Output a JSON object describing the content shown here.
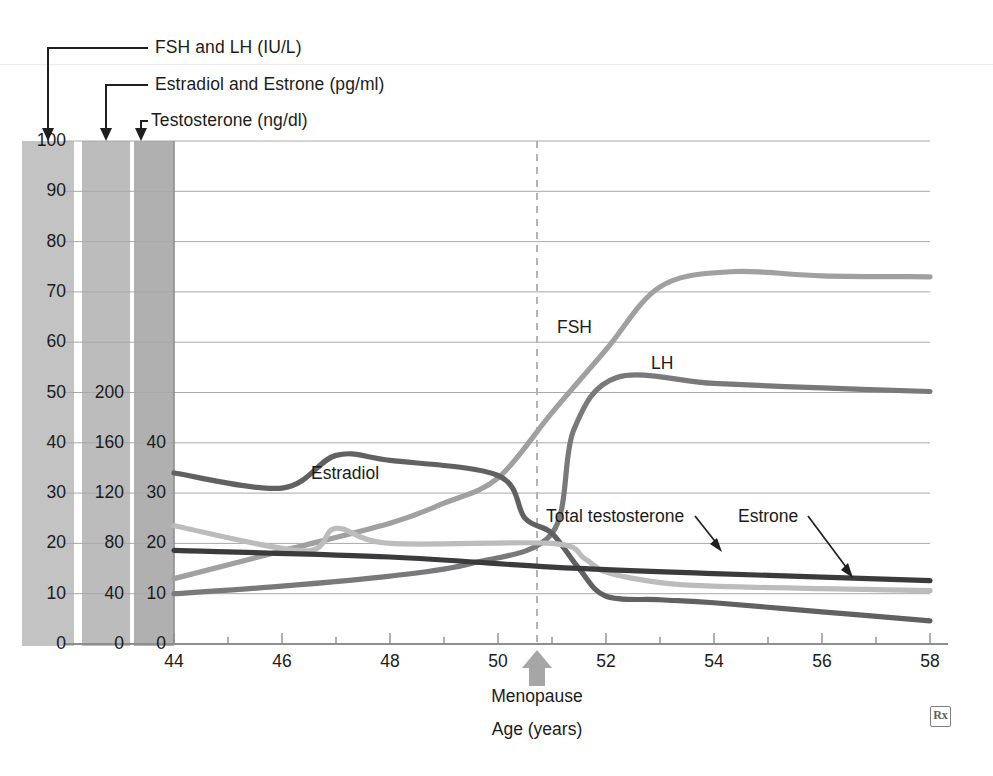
{
  "figure": {
    "axis_callouts": [
      {
        "id": "fsh-lh-axis",
        "label": "FSH and LH (IU/L)"
      },
      {
        "id": "estradiol-estrone-axis",
        "label": "Estradiol and Estrone (pg/ml)"
      },
      {
        "id": "testosterone-axis",
        "label": "Testosterone (ng/dl)"
      }
    ],
    "menopause_marker": {
      "label": "Menopause",
      "age": 51
    },
    "xaxis_title": "Age (years)",
    "watermark": "Rx"
  },
  "chart_data": {
    "type": "line",
    "title": "",
    "xlabel": "Age (years)",
    "ylabel": "",
    "xlim": [
      44,
      58
    ],
    "xticks": [
      44,
      46,
      48,
      50,
      52,
      54,
      56,
      58
    ],
    "xtick_labels": [
      "44",
      "46",
      "48",
      "50",
      "52",
      "54",
      "56",
      "58"
    ],
    "minor_xticks": [
      45,
      47,
      49,
      51,
      53,
      55,
      57
    ],
    "grid": true,
    "legend": "inline-labels",
    "annotations": [
      {
        "text": "Menopause",
        "x": 51,
        "kind": "arrow-up-dashed-line"
      },
      {
        "text": "FSH",
        "x": 51.6,
        "y": 62
      },
      {
        "text": "LH",
        "x": 53.0,
        "y": 56
      },
      {
        "text": "Estradiol",
        "x": 47.4,
        "y": 31
      },
      {
        "text": "Total testosterone",
        "x": 51.1,
        "y": 23
      },
      {
        "text": "Estrone",
        "x": 54.2,
        "y": 23
      }
    ],
    "axes": [
      {
        "id": "fsh-lh-axis",
        "name": "FSH and LH",
        "units": "IU/L",
        "ylim": [
          0,
          100
        ],
        "ticks": [
          0,
          10,
          20,
          30,
          40,
          50,
          60,
          70,
          80,
          90,
          100
        ],
        "tick_labels": [
          "0",
          "10",
          "20",
          "30",
          "40",
          "50",
          "60",
          "70",
          "80",
          "90",
          "100"
        ],
        "band_color": "#c3c3c3"
      },
      {
        "id": "estradiol-estrone-axis",
        "name": "Estradiol and Estrone",
        "units": "pg/ml",
        "ylim": [
          0,
          200
        ],
        "ticks": [
          0,
          40,
          80,
          120,
          160,
          200
        ],
        "tick_labels": [
          "0",
          "40",
          "80",
          "120",
          "160",
          "200"
        ],
        "band_color": "#bcbcbc"
      },
      {
        "id": "testosterone-axis",
        "name": "Testosterone",
        "units": "ng/dl",
        "ylim": [
          0,
          40
        ],
        "ticks": [
          0,
          10,
          20,
          30,
          40
        ],
        "tick_labels": [
          "0",
          "10",
          "20",
          "30",
          "40"
        ],
        "band_color": "#b0b0b0"
      }
    ],
    "series": [
      {
        "name": "FSH",
        "axis": "fsh-lh-axis",
        "units": "IU/L",
        "color": "#a0a0a0",
        "x": [
          44,
          46,
          48,
          49,
          50,
          51,
          52,
          53,
          54.3,
          56,
          58
        ],
        "values": [
          13,
          18.5,
          24,
          28,
          33,
          46,
          58.5,
          71,
          74,
          73.2,
          73
        ]
      },
      {
        "name": "LH",
        "axis": "fsh-lh-axis",
        "units": "IU/L",
        "color": "#79797b",
        "x": [
          44,
          46,
          48,
          49.5,
          51,
          51.4,
          52.2,
          54,
          56,
          58
        ],
        "values": [
          10,
          11.5,
          13.5,
          16,
          22,
          42.5,
          53,
          51.8,
          50.9,
          50.2
        ]
      },
      {
        "name": "Estradiol",
        "axis": "estradiol-estrone-axis",
        "units": "pg/ml",
        "scaled_as_fsh_units": true,
        "color": "#616163",
        "x": [
          44,
          46,
          47,
          48,
          50,
          50.5,
          51,
          51.5,
          52,
          53,
          54,
          56,
          58
        ],
        "values": [
          34,
          31,
          37.5,
          36.5,
          33.5,
          25,
          22,
          15,
          9.5,
          8.8,
          8.2,
          6.4,
          4.6
        ]
      },
      {
        "name": "Estrone",
        "axis": "estradiol-estrone-axis",
        "units": "pg/ml",
        "scaled_as_fsh_units": true,
        "color": "#bcbcbc",
        "x": [
          44,
          46.4,
          47,
          48,
          51,
          51.6,
          52,
          53,
          54,
          56,
          58
        ],
        "values": [
          23.5,
          18.5,
          23,
          20,
          20,
          17,
          14.3,
          12.2,
          11.5,
          11,
          10.6
        ]
      },
      {
        "name": "Total testosterone",
        "axis": "testosterone-axis",
        "units": "ng/dl",
        "scaled_as_fsh_units": true,
        "color": "#3b3b3d",
        "x": [
          44,
          48,
          51,
          54,
          58
        ],
        "values": [
          18.6,
          17.3,
          15.3,
          14.0,
          12.6
        ]
      }
    ]
  }
}
